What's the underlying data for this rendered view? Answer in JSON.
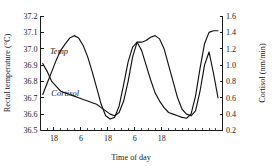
{
  "chart_data": {
    "type": "line",
    "title": "",
    "xlabel": "Time of day",
    "ylabel": "Rectal temperature (°C)",
    "y2label": "Cortisol (nm/min)",
    "grid": false,
    "legend_position": "inline-curve-labels",
    "xlim": [
      12,
      93
    ],
    "ylim": [
      36.5,
      37.2
    ],
    "y2lim": [
      0.2,
      1.6
    ],
    "x_tick_labels": [
      "18",
      "6",
      "18",
      "6",
      "18"
    ],
    "x_tick_values": [
      18,
      30,
      42,
      54,
      66
    ],
    "x_minor_step": 3,
    "y_tick_labels": [
      "36.5",
      "36.6",
      "36.7",
      "36.8",
      "36.9",
      "37.0",
      "37.1",
      "37.2"
    ],
    "y_tick_values": [
      36.5,
      36.6,
      36.7,
      36.8,
      36.9,
      37.0,
      37.1,
      37.2
    ],
    "y2_tick_labels": [
      "0.2",
      "0.4",
      "0.6",
      "0.8",
      "1.0",
      "1.2",
      "1.4",
      "1.6"
    ],
    "y2_tick_values": [
      0.2,
      0.4,
      0.6,
      0.8,
      1.0,
      1.2,
      1.4,
      1.6
    ],
    "series": [
      {
        "name": "Temp",
        "label": "Temp",
        "axis": "left",
        "units": "°C",
        "label_x": 16.2,
        "label_y": 36.97,
        "x": [
          13,
          15,
          17,
          19,
          21,
          23,
          25,
          27,
          29,
          31,
          33,
          35,
          37,
          39,
          41,
          43,
          45,
          47,
          49,
          51,
          53,
          55,
          57,
          59,
          61,
          63,
          65,
          67,
          69,
          71,
          73,
          75,
          77,
          79,
          81,
          83,
          85,
          87,
          89,
          91
        ],
        "y": [
          36.91,
          36.86,
          36.8,
          36.77,
          36.74,
          36.73,
          36.72,
          36.71,
          36.7,
          36.69,
          36.68,
          36.67,
          36.66,
          36.64,
          36.62,
          36.6,
          36.59,
          36.61,
          36.68,
          36.8,
          36.95,
          37.04,
          37.04,
          37.05,
          37.07,
          37.08,
          37.06,
          37.0,
          36.9,
          36.8,
          36.7,
          36.63,
          36.6,
          36.59,
          36.62,
          36.74,
          36.9,
          36.98,
          36.85,
          36.7
        ]
      },
      {
        "name": "Cortisol",
        "label": "Cortisol",
        "axis": "right",
        "units": "nm/min",
        "label_x": 16.8,
        "label_y": 36.71,
        "x": [
          13,
          15,
          17,
          19,
          21,
          23,
          25,
          27,
          29,
          31,
          33,
          35,
          37,
          39,
          41,
          43,
          45,
          47,
          49,
          51,
          53,
          55,
          57,
          59,
          61,
          63,
          65,
          67,
          69,
          71,
          73,
          75,
          77,
          79,
          81,
          83,
          85,
          87,
          89,
          91
        ],
        "y": [
          0.64,
          0.78,
          0.92,
          1.06,
          1.18,
          1.26,
          1.33,
          1.36,
          1.33,
          1.24,
          1.1,
          0.92,
          0.72,
          0.52,
          0.38,
          0.34,
          0.36,
          0.5,
          0.76,
          1.04,
          1.22,
          1.28,
          1.18,
          1.0,
          0.82,
          0.66,
          0.56,
          0.48,
          0.42,
          0.4,
          0.38,
          0.36,
          0.35,
          0.4,
          0.62,
          0.96,
          1.26,
          1.4,
          1.42,
          1.42
        ]
      }
    ]
  }
}
